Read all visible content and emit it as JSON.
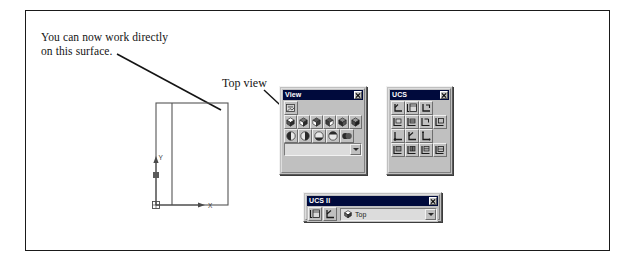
{
  "figure": {
    "callout_note": "You can now work directly\non this surface.",
    "topview_label": "Top view",
    "axis_x_label": "X",
    "axis_y_label": "Y"
  },
  "colors": {
    "titlebar": "#000a3c",
    "titlebar_text": "#ffffff",
    "toolbar_face": "#c0c0c0",
    "frame_line": "#1a1a1a",
    "drawing_line": "#4a4a4a"
  },
  "palettes": {
    "view": {
      "title": "View",
      "close_label": "x",
      "rows": [
        {
          "name": "named-views",
          "buttons": [
            {
              "name": "named-views-icon",
              "tip": "Named Views"
            }
          ]
        },
        {
          "name": "standard-views",
          "buttons": [
            {
              "name": "top-view-icon",
              "tip": "Top View"
            },
            {
              "name": "bottom-view-icon",
              "tip": "Bottom View"
            },
            {
              "name": "left-view-icon",
              "tip": "Left View"
            },
            {
              "name": "right-view-icon",
              "tip": "Right View"
            },
            {
              "name": "front-view-icon",
              "tip": "Front View"
            },
            {
              "name": "back-view-icon",
              "tip": "Back View"
            }
          ]
        },
        {
          "name": "isometric-views",
          "buttons": [
            {
              "name": "sw-isometric-icon",
              "tip": "SW Isometric View"
            },
            {
              "name": "se-isometric-icon",
              "tip": "SE Isometric View"
            },
            {
              "name": "ne-isometric-icon",
              "tip": "NE Isometric View"
            },
            {
              "name": "nw-isometric-icon",
              "tip": "NW Isometric View"
            },
            {
              "name": "camera-icon",
              "tip": "Camera"
            }
          ]
        }
      ],
      "combo": {
        "name": "view-combo",
        "value": "",
        "placeholder": ""
      }
    },
    "ucs": {
      "title": "UCS",
      "close_label": "x",
      "rows": [
        {
          "name": "ucs-row-1",
          "buttons": [
            {
              "name": "ucs-icon",
              "tip": "UCS"
            },
            {
              "name": "display-ucs-dialog-icon",
              "tip": "Display UCS Dialog"
            },
            {
              "name": "ucs-previous-icon",
              "tip": "UCS Previous"
            }
          ]
        },
        {
          "name": "ucs-row-2",
          "buttons": [
            {
              "name": "world-ucs-icon",
              "tip": "World UCS"
            },
            {
              "name": "object-ucs-icon",
              "tip": "Object UCS"
            },
            {
              "name": "face-ucs-icon",
              "tip": "Face UCS"
            },
            {
              "name": "view-ucs-icon",
              "tip": "View UCS"
            }
          ]
        },
        {
          "name": "ucs-row-3",
          "buttons": [
            {
              "name": "origin-ucs-icon",
              "tip": "Origin UCS"
            },
            {
              "name": "z-axis-vector-ucs-icon",
              "tip": "Z Axis Vector UCS"
            },
            {
              "name": "three-point-ucs-icon",
              "tip": "3 Point UCS"
            }
          ]
        },
        {
          "name": "ucs-row-4",
          "buttons": [
            {
              "name": "x-axis-rotate-ucs-icon",
              "tip": "X Axis Rotate UCS"
            },
            {
              "name": "y-axis-rotate-ucs-icon",
              "tip": "Y Axis Rotate UCS"
            },
            {
              "name": "z-axis-rotate-ucs-icon",
              "tip": "Z Axis Rotate UCS"
            },
            {
              "name": "apply-ucs-icon",
              "tip": "Apply UCS"
            }
          ]
        }
      ]
    },
    "ucs2": {
      "title": "UCS II",
      "close_label": "x",
      "buttons": [
        {
          "name": "display-ucs-dialog-icon",
          "tip": "Display UCS Dialog"
        },
        {
          "name": "move-ucs-origin-icon",
          "tip": "Move UCS Origin"
        }
      ],
      "combo": {
        "name": "ucs-preset-combo",
        "value": "Top",
        "placeholder": "Top"
      }
    }
  }
}
